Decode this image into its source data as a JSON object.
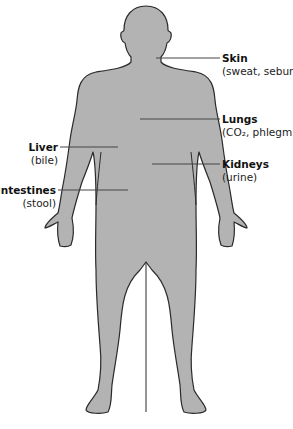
{
  "diagram": {
    "type": "anatomical-figure",
    "colors": {
      "body_fill": "#b3b3b3",
      "body_outline": "#2a2a2a",
      "leader_line": "#444444",
      "background": "#ffffff"
    },
    "labels": [
      {
        "id": "skin",
        "name": "Skin",
        "detail": "(sweat, sebum)",
        "side": "right"
      },
      {
        "id": "lungs",
        "name": "Lungs",
        "detail": "(CO₂, phlegm)",
        "side": "right"
      },
      {
        "id": "liver",
        "name": "Liver",
        "detail": "(bile)",
        "side": "left"
      },
      {
        "id": "kidneys",
        "name": "Kidneys",
        "detail": "(urine)",
        "side": "right"
      },
      {
        "id": "intestines",
        "name": "Intestines",
        "detail": "(stool)",
        "side": "left"
      }
    ]
  }
}
